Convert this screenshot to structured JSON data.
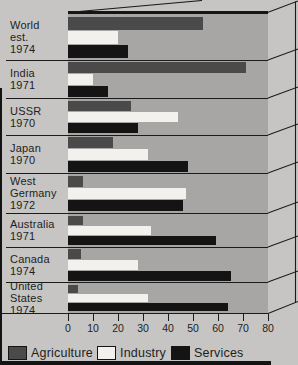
{
  "colors": {
    "background": "#c6c5c3",
    "plot_area": "#a7a6a4",
    "line": "#1b1b1b",
    "agriculture": "#4a4a4a",
    "industry": "#f2f1ee",
    "services": "#141414"
  },
  "chart_data": {
    "type": "bar",
    "orientation": "horizontal",
    "grouped": true,
    "categories": [
      "World est. 1974",
      "India 1971",
      "USSR 1970",
      "Japan 1970",
      "West Germany 1972",
      "Australia 1971",
      "Canada 1974",
      "United States 1974"
    ],
    "category_label_lines": [
      [
        "World",
        "est.",
        "1974"
      ],
      [
        "India",
        "1971"
      ],
      [
        "USSR",
        "1970"
      ],
      [
        "Japan",
        "1970"
      ],
      [
        "West",
        "Germany",
        "1972"
      ],
      [
        "Australia",
        "1971"
      ],
      [
        "Canada",
        "1974"
      ],
      [
        "United",
        "States",
        "1974"
      ]
    ],
    "series": [
      {
        "name": "Agriculture",
        "color": "#4a4a4a",
        "values": [
          54,
          71,
          25,
          18,
          6,
          6,
          5,
          4
        ]
      },
      {
        "name": "Industry",
        "color": "#f2f1ee",
        "values": [
          20,
          10,
          44,
          32,
          47,
          33,
          28,
          32
        ]
      },
      {
        "name": "Services",
        "color": "#141414",
        "values": [
          24,
          16,
          28,
          48,
          46,
          59,
          65,
          64
        ]
      }
    ],
    "xlim": [
      0,
      80
    ],
    "xticks": [
      0,
      10,
      20,
      30,
      40,
      50,
      60,
      70,
      80
    ],
    "grid": false,
    "legend": [
      "Agriculture",
      "Industry",
      "Services"
    ],
    "legend_position": "bottom",
    "style": "3d-slab-perspective"
  },
  "legend_labels": {
    "agriculture": "Agriculture",
    "industry": "Industry",
    "services": "Services"
  }
}
